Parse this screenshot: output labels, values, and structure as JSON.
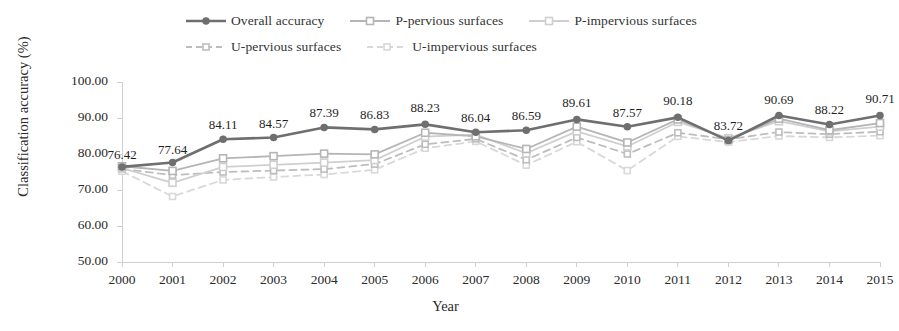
{
  "chart_data": {
    "type": "line",
    "title": "",
    "xlabel": "Year",
    "ylabel": "Classification accuracy (%)",
    "categories": [
      "2000",
      "2001",
      "2002",
      "2003",
      "2004",
      "2005",
      "2006",
      "2007",
      "2008",
      "2009",
      "2010",
      "2011",
      "2012",
      "2013",
      "2014",
      "2015"
    ],
    "x": [
      2000,
      2001,
      2002,
      2003,
      2004,
      2005,
      2006,
      2007,
      2008,
      2009,
      2010,
      2011,
      2012,
      2013,
      2014,
      2015
    ],
    "ylim": [
      50,
      100
    ],
    "ytick_values": [
      50,
      60,
      70,
      80,
      90,
      100
    ],
    "ytick_labels": [
      "50.00",
      "60.00",
      "70.00",
      "80.00",
      "90.00",
      "100.00"
    ],
    "grid": false,
    "legend_position": "top",
    "data_labels_series": "Overall accuracy",
    "series": [
      {
        "name": "Overall accuracy",
        "color": "#6f6f6f",
        "line_style": "solid",
        "line_width": 2.6,
        "marker": "circle",
        "marker_size": 7.5,
        "values": [
          76.42,
          77.64,
          84.11,
          84.57,
          87.39,
          86.83,
          88.23,
          86.04,
          86.59,
          89.61,
          87.57,
          90.18,
          83.72,
          90.69,
          88.22,
          90.71
        ],
        "labels": [
          "76.42",
          "77.64",
          "84.11",
          "84.57",
          "87.39",
          "86.83",
          "88.23",
          "86.04",
          "86.59",
          "89.61",
          "87.57",
          "90.18",
          "83.72",
          "90.69",
          "88.22",
          "90.71"
        ]
      },
      {
        "name": "P-pervious surfaces",
        "color": "#b5b5b5",
        "line_style": "solid",
        "line_width": 1.8,
        "marker": "square",
        "marker_size": 7,
        "values": [
          76.6,
          75.3,
          78.8,
          79.4,
          80.1,
          79.9,
          85.9,
          84.9,
          81.4,
          87.6,
          83.2,
          89.6,
          83.9,
          89.8,
          86.6,
          88.6
        ]
      },
      {
        "name": "P-impervious surfaces",
        "color": "#cfcfcf",
        "line_style": "solid",
        "line_width": 1.8,
        "marker": "square",
        "marker_size": 7,
        "values": [
          76.1,
          72.0,
          76.4,
          77.0,
          77.6,
          78.3,
          84.8,
          85.4,
          80.2,
          86.3,
          82.1,
          88.9,
          84.4,
          89.1,
          86.3,
          87.6
        ]
      },
      {
        "name": "U-pervious surfaces",
        "color": "#bdbdbd",
        "line_style": "dashed",
        "line_width": 1.8,
        "marker": "square",
        "marker_size": 6,
        "values": [
          75.9,
          74.1,
          75.0,
          75.4,
          75.8,
          77.2,
          82.7,
          84.2,
          78.4,
          84.6,
          80.0,
          85.9,
          84.1,
          86.1,
          85.5,
          86.2
        ]
      },
      {
        "name": "U-impervious surfaces",
        "color": "#d8d8d8",
        "line_style": "dashed",
        "line_width": 1.8,
        "marker": "square",
        "marker_size": 6,
        "values": [
          75.2,
          68.2,
          72.8,
          73.6,
          74.3,
          75.6,
          81.6,
          83.5,
          76.9,
          83.4,
          75.4,
          84.9,
          83.3,
          85.0,
          84.6,
          85.1
        ]
      }
    ]
  },
  "legend": {
    "items": [
      {
        "label": "Overall accuracy"
      },
      {
        "label": "P-pervious surfaces"
      },
      {
        "label": "P-impervious surfaces"
      },
      {
        "label": "U-pervious surfaces"
      },
      {
        "label": "U-impervious surfaces"
      }
    ]
  },
  "axes": {
    "y_title": "Classification accuracy (%)",
    "x_title": "Year"
  }
}
